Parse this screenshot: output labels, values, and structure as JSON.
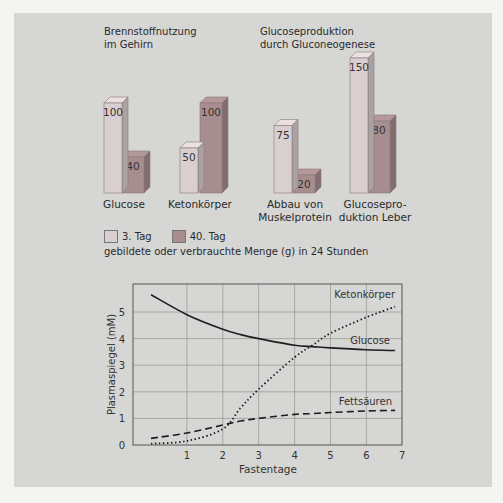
{
  "top": {
    "group1_title": [
      "Brennstoffnutzung",
      "im Gehirn"
    ],
    "group2_title": [
      "Glucoseproduktion",
      "durch Gluconeogenese"
    ],
    "legend": [
      {
        "label": "3. Tag",
        "color": "#d9cfd0"
      },
      {
        "label": "40. Tag",
        "color": "#a78d8f"
      }
    ],
    "caption": "gebildete oder verbrauchte Menge (g) in 24 Stunden",
    "categories": [
      "Glucose",
      "Ketonkörper",
      "Abbau von Muskelprotein",
      "Glucoseproduktion Leber"
    ],
    "category_lines": [
      [
        "Glucose"
      ],
      [
        "Ketonkörper"
      ],
      [
        "Abbau von",
        "Muskelprotein"
      ],
      [
        "Glucosepro-",
        "duktion Leber"
      ]
    ]
  },
  "bottom": {
    "ylabel": "Plasmaspiegel (mM)",
    "xlabel": "Fastentage",
    "series_labels": {
      "ketone": "Ketonkörper",
      "glucose": "Glucose",
      "fatty": "Fettsäuren"
    }
  },
  "chart_data": [
    {
      "type": "bar",
      "title": "Brennstoffnutzung im Gehirn / Glucoseproduktion durch Gluconeogenese",
      "categories": [
        "Glucose",
        "Ketonkörper",
        "Abbau von Muskelprotein",
        "Glucoseproduktion Leber"
      ],
      "series": [
        {
          "name": "3. Tag",
          "values": [
            100,
            50,
            75,
            150
          ]
        },
        {
          "name": "40. Tag",
          "values": [
            40,
            100,
            20,
            80
          ]
        }
      ],
      "ylabel": "gebildete oder verbrauchte Menge (g) in 24 Stunden",
      "legend_position": "bottom-left"
    },
    {
      "type": "line",
      "xlabel": "Fastentage",
      "ylabel": "Plasmaspiegel (mM)",
      "xlim": [
        -0.5,
        7
      ],
      "ylim": [
        0,
        6
      ],
      "xticks": [
        1,
        2,
        3,
        4,
        5,
        6,
        7
      ],
      "yticks": [
        0,
        1,
        2,
        3,
        4,
        5
      ],
      "grid": true,
      "x": [
        0,
        1,
        2,
        2.5,
        3,
        4,
        4.5,
        5,
        6,
        6.8
      ],
      "series": [
        {
          "name": "Glucose",
          "style": "solid",
          "values": [
            5.65,
            4.9,
            4.35,
            4.15,
            4.0,
            3.75,
            3.7,
            3.65,
            3.58,
            3.55
          ]
        },
        {
          "name": "Ketonkörper",
          "style": "dotted",
          "values": [
            0.05,
            0.15,
            0.6,
            1.4,
            2.1,
            3.3,
            3.75,
            4.2,
            4.8,
            5.2
          ]
        },
        {
          "name": "Fettsäuren",
          "style": "dashed",
          "values": [
            0.25,
            0.45,
            0.75,
            0.9,
            1.0,
            1.15,
            1.18,
            1.22,
            1.28,
            1.3
          ]
        }
      ]
    }
  ]
}
